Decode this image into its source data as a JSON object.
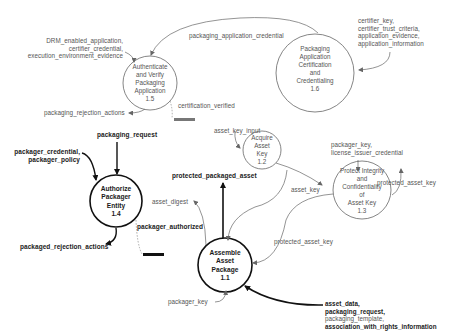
{
  "diagram": {
    "type": "data-flow-diagram",
    "processes": [
      {
        "id": "1.1",
        "lines": [
          "Assemble",
          "Asset",
          "Package"
        ],
        "number": "1.1",
        "emphasis": "bold"
      },
      {
        "id": "1.2",
        "lines": [
          "Acquire",
          "Asset",
          "Key"
        ],
        "number": "1.2",
        "emphasis": "normal"
      },
      {
        "id": "1.3",
        "lines": [
          "Protect Integrity",
          "and",
          "Confidentiality",
          "of",
          "Asset Key"
        ],
        "number": "1.3",
        "emphasis": "normal"
      },
      {
        "id": "1.4",
        "lines": [
          "Authorize",
          "Packager",
          "Entity"
        ],
        "number": "1.4",
        "emphasis": "bold"
      },
      {
        "id": "1.5",
        "lines": [
          "Authenticate",
          "and Verify",
          "Packaging",
          "Application"
        ],
        "number": "1.5",
        "emphasis": "normal"
      },
      {
        "id": "1.6",
        "lines": [
          "Packaging",
          "Application",
          "Certification",
          "and",
          "Credentialing"
        ],
        "number": "1.6",
        "emphasis": "normal"
      }
    ],
    "flows": {
      "drm_inputs": [
        "DRM_enabled_application,",
        "certifier_credential,",
        "execution_environment_evidence"
      ],
      "packaging_application_credential": "packaging_application_credential",
      "certifier_inputs": [
        "certifier_key,",
        "certifier_trust_criteria,",
        "application_evidence,",
        "application_information"
      ],
      "packaging_rejection_actions": "packaging_rejection_actions",
      "certification_verified": "certification_verified",
      "packaging_request": "packaging_request",
      "packager_inputs": [
        "packager_credential,",
        "packager_policy"
      ],
      "packaged_rejection_actions": "packaged_rejection_actions",
      "packager_authorized": "packager_authorized",
      "asset_key_input": "asset_key_input",
      "protected_packaged_asset": "protected_packaged_asset",
      "asset_digest": "asset_digest",
      "asset_key": "asset_key",
      "packager_key_license": [
        "packager_key,",
        "license_issuer_credential"
      ],
      "protected_asset_key_out": "protected_asset_key",
      "protected_asset_key_in": "protected_asset_key",
      "packager_key": "packager_key",
      "asset_inputs": [
        "asset_data,",
        "packaging_request,",
        "packaging_template,",
        "association_with_rights_information"
      ]
    },
    "colors": {
      "primary_line": "#111111",
      "secondary_line": "#777777",
      "text_bold": "#1a1a1a",
      "text_light": "#555555"
    }
  }
}
